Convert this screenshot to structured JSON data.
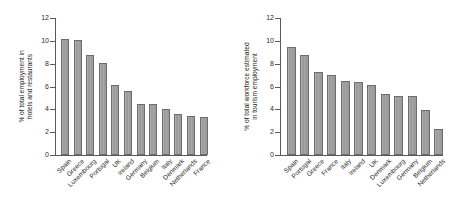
{
  "figure": {
    "background_color": "#ffffff",
    "bar_color": "#9b9b9b",
    "bar_border_color": "#6d6d6d",
    "axis_color": "#5a5a5a"
  },
  "panels": [
    {
      "name": "left-chart",
      "ylabel_line1": "% of total employment in",
      "ylabel_line2": "hotels and restaurants",
      "yticks": [
        "0",
        "2",
        "4",
        "6",
        "8",
        "10",
        "12"
      ]
    },
    {
      "name": "right-chart",
      "ylabel_line1": "% of total workforce estimated",
      "ylabel_line2": "in tourism employment",
      "yticks": [
        "0",
        "2",
        "4",
        "6",
        "8",
        "10",
        "12"
      ]
    }
  ],
  "chart_data": [
    {
      "type": "bar",
      "title": "",
      "xlabel": "",
      "ylabel": "% of total employment in hotels and restaurants",
      "ylim": [
        0,
        12
      ],
      "yticks": [
        0,
        2,
        4,
        6,
        8,
        10,
        12
      ],
      "grid": false,
      "legend": "none",
      "categories": [
        "Spain",
        "Greece",
        "Luxembourg",
        "Portugal",
        "UK",
        "Ireland",
        "Germany",
        "Belgium",
        "Italy",
        "Denmark",
        "Netherlands",
        "France"
      ],
      "values": [
        10.2,
        10.1,
        8.8,
        8.1,
        6.1,
        5.6,
        4.45,
        4.45,
        4.05,
        3.55,
        3.45,
        3.35
      ]
    },
    {
      "type": "bar",
      "title": "",
      "xlabel": "",
      "ylabel": "% of total workforce estimated in tourism employment",
      "ylim": [
        0,
        12
      ],
      "yticks": [
        0,
        2,
        4,
        6,
        8,
        10,
        12
      ],
      "grid": false,
      "legend": "none",
      "categories": [
        "Spain",
        "Portugal",
        "Greece",
        "France",
        "Italy",
        "Ireland",
        "UK",
        "Denmark",
        "Luxembourg",
        "Germany",
        "Belgium",
        "Netherlands"
      ],
      "values": [
        9.45,
        8.8,
        7.3,
        7.0,
        6.45,
        6.4,
        6.1,
        5.35,
        5.2,
        5.2,
        3.9,
        2.25
      ]
    }
  ]
}
